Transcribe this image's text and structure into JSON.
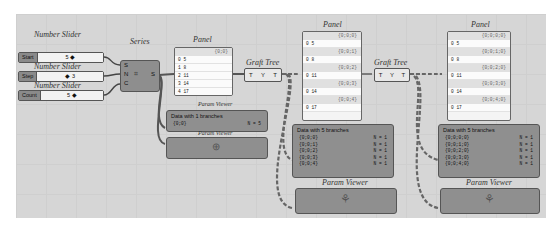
{
  "sliders": [
    {
      "title": "Number Slider",
      "label": "Start",
      "value": "5 ◆"
    },
    {
      "title": "Number Slider",
      "label": "Step",
      "value": "◆ 3"
    },
    {
      "title": "Number Slider",
      "label": "Count",
      "value": "5 ◆"
    }
  ],
  "series": {
    "title": "Series",
    "inputs": [
      "S",
      "N",
      "C"
    ],
    "output": "S"
  },
  "panel1": {
    "title": "Panel",
    "path": "{0;0}",
    "rows": [
      "0  5",
      "1  8",
      "2  11",
      "3  14",
      "4  17"
    ]
  },
  "graft1": {
    "title": "Graft Tree",
    "in": "T",
    "out": "T"
  },
  "viewer1": {
    "title": "Param Viewer",
    "header": "Data with 1 branches",
    "lines": [
      {
        "path": "{0;0}",
        "count": "N = 5"
      }
    ]
  },
  "viewer1b": {
    "title": "Param Viewer"
  },
  "panel2": {
    "title": "Panel",
    "groups": [
      {
        "path": "{0;0;0}",
        "row": "0  5"
      },
      {
        "path": "{0;0;1}",
        "row": "0  8"
      },
      {
        "path": "{0;0;2}",
        "row": "0  11"
      },
      {
        "path": "{0;0;3}",
        "row": "0  14"
      },
      {
        "path": "{0;0;4}",
        "row": "0  17"
      }
    ]
  },
  "graft2": {
    "title": "Graft Tree",
    "in": "T",
    "out": "T"
  },
  "viewer2": {
    "title": "Param Viewer",
    "header": "Data with 5 branches",
    "lines": [
      {
        "path": "{0;0;0}",
        "count": "N = 1"
      },
      {
        "path": "{0;0;1}",
        "count": "N = 1"
      },
      {
        "path": "{0;0;2}",
        "count": "N = 1"
      },
      {
        "path": "{0;0;3}",
        "count": "N = 1"
      },
      {
        "path": "{0;0;4}",
        "count": "N = 1"
      }
    ]
  },
  "viewer2b": {
    "title": "Param Viewer"
  },
  "panel3": {
    "title": "Panel",
    "groups": [
      {
        "path": "{0;0;0;0}",
        "row": "0  5"
      },
      {
        "path": "{0;0;1;0}",
        "row": "0  8"
      },
      {
        "path": "{0;0;2;0}",
        "row": "0  11"
      },
      {
        "path": "{0;0;3;0}",
        "row": "0  14"
      },
      {
        "path": "{0;0;4;0}",
        "row": "0  17"
      }
    ]
  },
  "viewer3": {
    "title": "Param Viewer",
    "header": "Data with 5 branches",
    "lines": [
      {
        "path": "{0;0;0;0}",
        "count": "N = 1"
      },
      {
        "path": "{0;0;1;0}",
        "count": "N = 1"
      },
      {
        "path": "{0;0;2;0}",
        "count": "N = 1"
      },
      {
        "path": "{0;0;3;0}",
        "count": "N = 1"
      },
      {
        "path": "{0;0;4;0}",
        "count": "N = 1"
      }
    ]
  },
  "viewer3b": {
    "title": "Param Viewer"
  }
}
